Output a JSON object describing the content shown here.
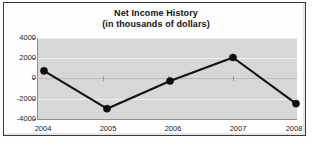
{
  "chart_data": {
    "type": "line",
    "title": "Net Income History",
    "subtitle": "(in thousands of dollars)",
    "xlabel": "",
    "ylabel": "",
    "categories": [
      "2004",
      "2005",
      "2006",
      "2007",
      "2008"
    ],
    "values": [
      800,
      -2900,
      -200,
      2100,
      -2400
    ],
    "series": [
      {
        "name": "Net Income",
        "values": [
          800,
          -2900,
          -200,
          2100,
          -2400
        ]
      }
    ],
    "ylim": [
      -4000,
      4000
    ],
    "yticks": [
      "4000",
      "2000",
      "0",
      "-2000",
      "-4000"
    ],
    "ytick_values": [
      4000,
      2000,
      0,
      -2000,
      -4000
    ],
    "grid": true,
    "legend": "none",
    "marker": "filled-circle",
    "line_color": "#111111",
    "plot_background": "#d7d7d7"
  }
}
